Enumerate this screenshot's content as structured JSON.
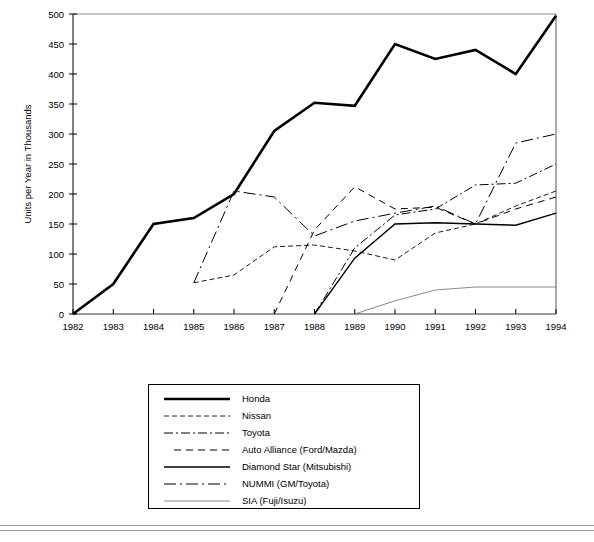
{
  "chart_data": {
    "type": "line",
    "title": "",
    "xlabel": "",
    "ylabel": "Units per Year in Thousands",
    "x": [
      1982,
      1983,
      1984,
      1985,
      1986,
      1987,
      1988,
      1989,
      1990,
      1991,
      1992,
      1993,
      1994
    ],
    "xtick_labels": [
      "1982",
      "1983",
      "1984",
      "1985",
      "1986",
      "1987",
      "1988",
      "1989",
      "1990",
      "1991",
      "1992",
      "1993",
      "1994"
    ],
    "ytick_labels": [
      "0",
      "50",
      "100",
      "150",
      "200",
      "250",
      "300",
      "350",
      "400",
      "450",
      "500"
    ],
    "yticks": [
      0,
      50,
      100,
      150,
      200,
      250,
      300,
      350,
      400,
      450,
      500
    ],
    "ylim": [
      0,
      500
    ],
    "xlim": [
      1982,
      1994
    ],
    "grid": false,
    "legend_position": "below-plot",
    "series": [
      {
        "name": "Honda",
        "style": "solid-thick",
        "x": [
          1982,
          1983,
          1984,
          1985,
          1986,
          1987,
          1988,
          1989,
          1990,
          1991,
          1992,
          1993,
          1994
        ],
        "values": [
          0,
          50,
          150,
          160,
          200,
          305,
          352,
          347,
          450,
          425,
          440,
          400,
          497
        ]
      },
      {
        "name": "Nissan",
        "style": "dashed-short",
        "x": [
          1985,
          1986,
          1987,
          1988,
          1989,
          1990,
          1991,
          1992,
          1993,
          1994
        ],
        "values": [
          52,
          65,
          112,
          115,
          105,
          90,
          135,
          150,
          180,
          205
        ]
      },
      {
        "name": "Toyota",
        "style": "dash-dot",
        "x": [
          1988,
          1989,
          1990,
          1991,
          1992,
          1993,
          1994
        ],
        "values": [
          0,
          110,
          165,
          175,
          215,
          218,
          250
        ]
      },
      {
        "name": "Auto Alliance (Ford/Mazda)",
        "style": "dashed-medium",
        "x": [
          1987,
          1988,
          1989,
          1990,
          1991,
          1992,
          1993,
          1994
        ],
        "values": [
          0,
          140,
          212,
          175,
          178,
          150,
          175,
          195
        ]
      },
      {
        "name": "Diamond Star (Mitsubishi)",
        "style": "solid-medium",
        "x": [
          1988,
          1989,
          1990,
          1991,
          1992,
          1993,
          1994
        ],
        "values": [
          0,
          93,
          150,
          152,
          150,
          148,
          168
        ]
      },
      {
        "name": "NUMMI (GM/Toyota)",
        "style": "long-dash-dot",
        "x": [
          1985,
          1986,
          1987,
          1988,
          1989,
          1990,
          1991,
          1992,
          1993,
          1994
        ],
        "values": [
          52,
          205,
          195,
          130,
          155,
          168,
          180,
          150,
          285,
          300
        ]
      },
      {
        "name": "SIA (Fuji/Isuzu)",
        "style": "solid-thin",
        "x": [
          1989,
          1990,
          1991,
          1992,
          1993,
          1994
        ],
        "values": [
          0,
          22,
          40,
          45,
          45,
          45
        ]
      }
    ]
  },
  "legend": {
    "entries": [
      {
        "label": "Honda",
        "style": "solid-thick"
      },
      {
        "label": "Nissan",
        "style": "dashed-short"
      },
      {
        "label": "Toyota",
        "style": "dash-dot"
      },
      {
        "label": "Auto Alliance (Ford/Mazda)",
        "style": "dashed-medium"
      },
      {
        "label": "Diamond Star (Mitsubishi)",
        "style": "solid-medium"
      },
      {
        "label": "NUMMI (GM/Toyota)",
        "style": "long-dash-dot"
      },
      {
        "label": "SIA (Fuji/Isuzu)",
        "style": "solid-thin"
      }
    ]
  },
  "colors": {
    "ink": "#000000",
    "frame": "#8a8a8a",
    "rule": "#9a9a9a",
    "background": "#ffffff"
  }
}
